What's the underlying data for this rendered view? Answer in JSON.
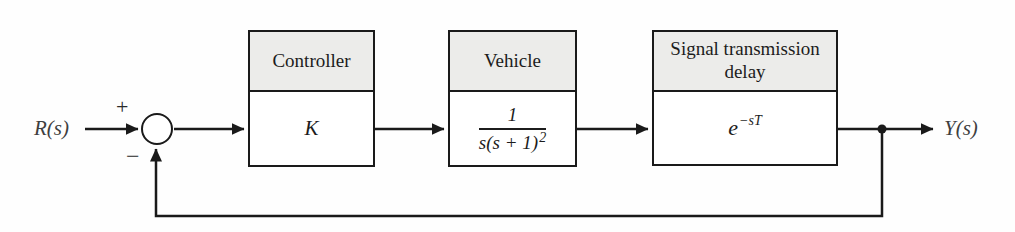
{
  "diagram": {
    "input_label": "R(s)",
    "output_label": "Y(s)",
    "summing_junction": {
      "plus": "+",
      "minus": "−"
    },
    "blocks": [
      {
        "title": "Controller",
        "expression": "K"
      },
      {
        "title": "Vehicle",
        "numerator": "1",
        "denominator": "s(s + 1)",
        "denominator_exponent": "2"
      },
      {
        "title": "Signal transmission delay",
        "base": "e",
        "exponent": "−sT"
      }
    ],
    "colors": {
      "line": "#1a1a1a",
      "header_fill": "#ececea",
      "block_fill": "#ffffff",
      "label": "#3f3f3f",
      "background": "#fefefe"
    }
  }
}
